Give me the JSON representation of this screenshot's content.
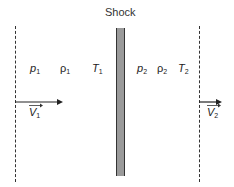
{
  "diagram": {
    "title": "Shock",
    "upstream": {
      "pressure": {
        "symbol": "p",
        "sub": "1"
      },
      "density": {
        "symbol": "ρ",
        "sub": "1"
      },
      "temperature": {
        "symbol": "T",
        "sub": "1"
      },
      "velocity": {
        "symbol": "V",
        "sub": "1"
      }
    },
    "downstream": {
      "pressure": {
        "symbol": "p",
        "sub": "2"
      },
      "density": {
        "symbol": "ρ",
        "sub": "2"
      },
      "temperature": {
        "symbol": "T",
        "sub": "2"
      },
      "velocity": {
        "symbol": "V",
        "sub": "2"
      }
    },
    "colors": {
      "shock_fill": "#9a9a9a",
      "line": "#333333"
    }
  }
}
